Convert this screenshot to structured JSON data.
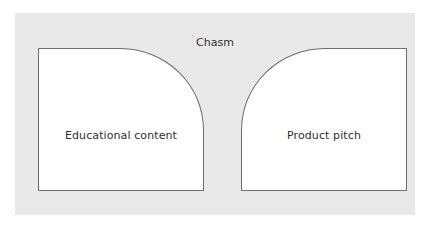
{
  "diagram": {
    "gap_label": "Chasm",
    "left_block": {
      "label": "Educational content"
    },
    "right_block": {
      "label": "Product pitch"
    }
  },
  "colors": {
    "background": "#e9e9e9",
    "block_fill": "#ffffff",
    "block_stroke": "#6e6e6e",
    "text": "#2f2f2f"
  }
}
